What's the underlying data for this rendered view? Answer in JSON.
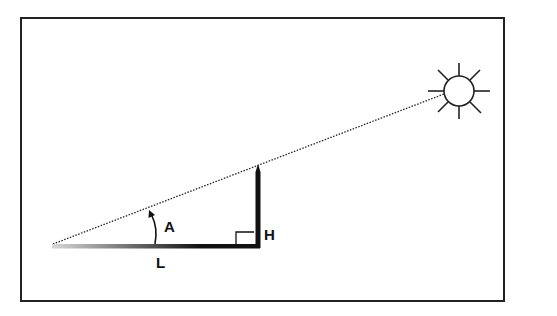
{
  "diagram": {
    "type": "sun-angle-shadow-diagram",
    "labels": {
      "angle": "A",
      "height": "H",
      "length": "L"
    },
    "elements": {
      "frame": {
        "x": 21,
        "y": 18,
        "width": 483,
        "height": 283
      },
      "ground_line": {
        "x1": 52,
        "y1": 246,
        "x2": 260,
        "y2": 246
      },
      "pole": {
        "x": 258,
        "y_top": 165,
        "y_bottom": 248
      },
      "sun": {
        "cx": 459,
        "cy": 91,
        "r": 15,
        "rays": 8
      },
      "sight_line": {
        "x1": 53,
        "y1": 244,
        "x2": 444,
        "y2": 94,
        "style": "dotted"
      },
      "right_angle_marker": {
        "x": 236,
        "y": 232,
        "size": 17
      }
    },
    "colors": {
      "stroke": "#111111",
      "background": "#ffffff",
      "gradient_start": "#d8d8d8",
      "gradient_end": "#111111"
    }
  }
}
